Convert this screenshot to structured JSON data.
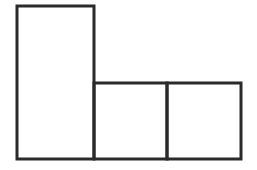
{
  "canvas": {
    "width": 257,
    "height": 170,
    "background": "#ffffff"
  },
  "stroke": {
    "color": "#2a2a2a",
    "width": 3
  },
  "shapes": [
    {
      "name": "tall-rectangle",
      "x": 17,
      "y": 6,
      "w": 77,
      "h": 153
    },
    {
      "name": "middle-square",
      "x": 94,
      "y": 83,
      "w": 73,
      "h": 76
    },
    {
      "name": "right-square",
      "x": 167,
      "y": 83,
      "w": 74,
      "h": 76
    }
  ]
}
